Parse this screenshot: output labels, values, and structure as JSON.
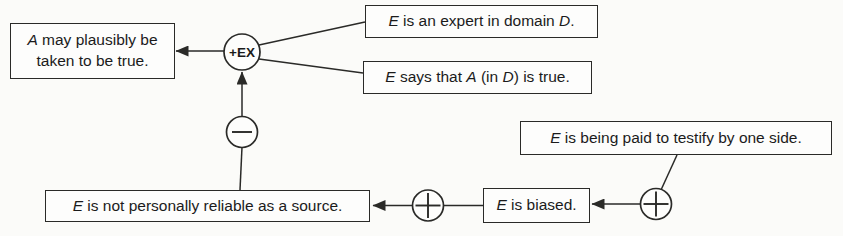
{
  "figure": {
    "type": "argument-diagram",
    "colors": {
      "ink": "#2a2a28",
      "paper": "#fbfbf9",
      "box_fill": "#fdfdfc",
      "text": "#1b1b1b"
    },
    "nodes": {
      "conclusion": {
        "segments": [
          "A",
          " may plausibly be taken to be true."
        ]
      },
      "expert": {
        "segments": [
          "E",
          " is an expert in domain ",
          "D",
          "."
        ]
      },
      "says": {
        "segments": [
          "E",
          " says that ",
          "A",
          " (in ",
          "D",
          ") is true."
        ]
      },
      "rebuttal": {
        "segments": [
          "E",
          " is not personally reliable as a source."
        ]
      },
      "biased": {
        "segments": [
          "E",
          " is biased."
        ]
      },
      "paid": {
        "segments": [
          "E",
          " is being paid to testify by one side."
        ]
      }
    },
    "circles": {
      "ex": {
        "label": "+EX",
        "kind": "pro-scheme-expert-opinion"
      },
      "minus": {
        "symbol": "−",
        "kind": "con"
      },
      "plus1": {
        "symbol": "+",
        "kind": "pro"
      },
      "plus2": {
        "symbol": "+",
        "kind": "pro"
      }
    },
    "edges": [
      {
        "from": "ex",
        "to": "conclusion",
        "arrow": true
      },
      {
        "from": "expert",
        "to": "ex",
        "arrow": false
      },
      {
        "from": "says",
        "to": "ex",
        "arrow": false
      },
      {
        "from": "minus",
        "to": "ex",
        "arrow": true
      },
      {
        "from": "rebuttal",
        "to": "minus",
        "arrow": false
      },
      {
        "from": "plus1",
        "to": "rebuttal",
        "arrow": true
      },
      {
        "from": "biased",
        "to": "plus1",
        "arrow": false
      },
      {
        "from": "plus2",
        "to": "biased",
        "arrow": true
      },
      {
        "from": "paid",
        "to": "plus2",
        "arrow": false
      }
    ]
  }
}
